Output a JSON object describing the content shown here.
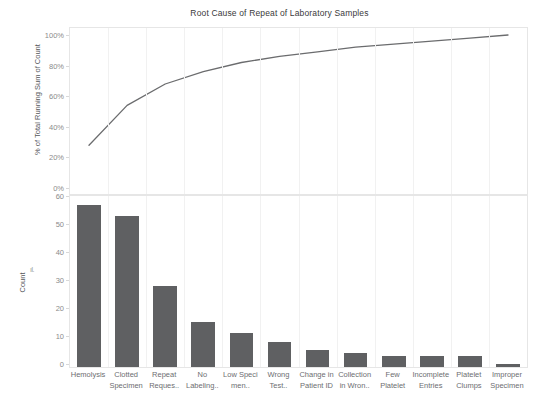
{
  "chart_data": {
    "type": "bar",
    "title": "Root Cause of Repeat of Laboratory Samples",
    "xlabel": "",
    "categories": [
      "Hemolysis",
      "Clotted Specimen",
      "Repeat Reques..",
      "No Labeling..",
      "Low Speci men..",
      "Wrong Test..",
      "Change in Patient ID",
      "Collection in Wron..",
      "Few Platelet",
      "Incomplete Entries",
      "Platelet Clumps",
      "Improper Specimen"
    ],
    "series": [
      {
        "name": "Count",
        "type": "bar",
        "values": [
          58,
          54,
          29,
          16,
          12,
          9,
          6,
          5,
          4,
          4,
          4,
          1
        ],
        "axis": "bottom",
        "ylabel": "Count",
        "ylim": [
          0,
          60
        ],
        "yticks": [
          0,
          10,
          20,
          30,
          40,
          50,
          60
        ],
        "ytick_labels": [
          "0",
          "10",
          "20",
          "30",
          "40",
          "50",
          "60"
        ],
        "color": "#5f6062"
      },
      {
        "name": "% of Total Running Sum of Count",
        "type": "line",
        "values": [
          28,
          54,
          68,
          76,
          82,
          86,
          89,
          92,
          94,
          96,
          98,
          100
        ],
        "axis": "top",
        "ylabel": "% of Total Running Sum of Count",
        "ylim": [
          0,
          100
        ],
        "yticks": [
          0,
          20,
          40,
          60,
          80,
          100
        ],
        "ytick_labels": [
          "0%",
          "20%",
          "40%",
          "60%",
          "80%",
          "100%"
        ],
        "color": "#6b6c6e"
      }
    ],
    "grid": true,
    "legend": "none"
  },
  "top_axis": {
    "title": "% of Total Running Sum of Count",
    "ticks": [
      "100%",
      "80%",
      "60%",
      "40%",
      "20%",
      "0%"
    ]
  },
  "bottom_axis": {
    "title": "Count",
    "sort_icon": "sort-descending-icon",
    "ticks": [
      "60",
      "50",
      "40",
      "30",
      "20",
      "10",
      "0"
    ]
  }
}
